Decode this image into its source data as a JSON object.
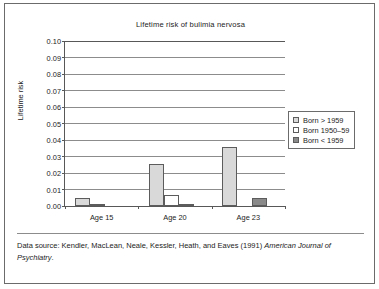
{
  "figure": {
    "caption_prefix": "Data source: Kendler, MacLean, Neale, Kessler, Heath, and Eaves (1991)",
    "caption_journal": "American Journal of Psychiatry",
    "caption_suffix": "."
  },
  "chart_data": {
    "type": "bar",
    "title": "Lifetime risk of bulimia nervosa",
    "xlabel": "",
    "ylabel": "Lifetime risk",
    "categories": [
      "Age 15",
      "Age 20",
      "Age 23"
    ],
    "series": [
      {
        "name": "Born > 1959",
        "color": "#d9d9d9",
        "values": [
          0.005,
          0.0255,
          0.0357
        ]
      },
      {
        "name": "Born 1950–59",
        "color": "#ffffff",
        "values": [
          0.001,
          0.0068,
          0.0
        ]
      },
      {
        "name": "Born < 1959",
        "color": "#8a8a8a",
        "values": [
          0.0,
          0.0012,
          0.005
        ]
      }
    ],
    "ylim": [
      0.0,
      0.1
    ],
    "ytick_step": 0.01,
    "ytick_labels": [
      "0.00",
      "0.01",
      "0.02",
      "0.03",
      "0.04",
      "0.05",
      "0.06",
      "0.07",
      "0.08",
      "0.09",
      "0.10"
    ],
    "ytick_values": [
      0.0,
      0.01,
      0.02,
      0.03,
      0.04,
      0.05,
      0.06,
      0.07,
      0.08,
      0.09,
      0.1
    ],
    "grid": true,
    "legend_position": "right"
  }
}
